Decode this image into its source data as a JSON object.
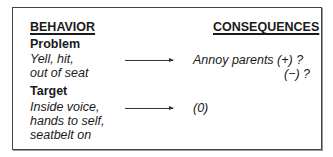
{
  "headers": {
    "behavior": "BEHAVIOR",
    "consequences": "CONSEQUENCES"
  },
  "rows": [
    {
      "label": "Problem",
      "behavior_lines": [
        "Yell, hit,",
        "out of seat"
      ],
      "consequence_lines": [
        "Annoy parents (+) ?",
        "(−) ?"
      ]
    },
    {
      "label": "Target",
      "behavior_lines": [
        "Inside voice,",
        "hands to self,",
        "seatbelt on"
      ],
      "consequence_lines": [
        "(0)"
      ]
    }
  ],
  "arrow_icon": "right-arrow-icon"
}
